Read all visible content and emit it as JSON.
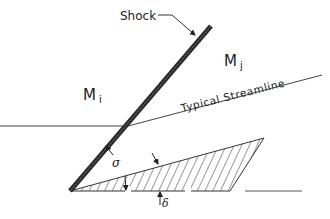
{
  "diagram": {
    "labels": {
      "shock": "Shock",
      "upstream_mach": "M",
      "upstream_sub": "i",
      "downstream_mach": "M",
      "downstream_sub": "j",
      "streamline": "Typical Streamline",
      "shock_angle": "σ",
      "deflection_angle": "δ"
    },
    "colors": {
      "line": "#333333",
      "shock": "#2a2a2a",
      "background": "#ffffff"
    }
  }
}
